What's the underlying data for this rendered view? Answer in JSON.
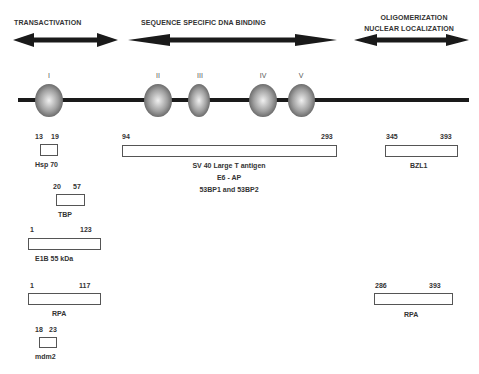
{
  "domains": [
    {
      "label": "TRANSACTIVATION"
    },
    {
      "label": "SEQUENCE SPECIFIC DNA BINDING"
    },
    {
      "label_line1": "OLIGOMERIZATION",
      "label_line2": "NUCLEAR LOCALIZATION"
    }
  ],
  "conserved_regions": [
    "I",
    "II",
    "III",
    "IV",
    "V"
  ],
  "binding_sites": [
    {
      "start": "13",
      "end": "19",
      "partner": "Hsp  70"
    },
    {
      "start": "20",
      "end": "57",
      "partner": "TBP"
    },
    {
      "start": "1",
      "end": "123",
      "partner": "E1B 55 kDa"
    },
    {
      "start": "1",
      "end": "117",
      "partner": "RPA"
    },
    {
      "start": "18",
      "end": "23",
      "partner": "mdm2"
    },
    {
      "start": "94",
      "end": "293",
      "partners": [
        "SV 40 Large T antigen",
        "E6 - AP",
        "53BP1 and 53BP2"
      ]
    },
    {
      "start": "345",
      "end": "393",
      "partner": "BZL1"
    },
    {
      "start": "286",
      "end": "393",
      "partner": "RPA"
    }
  ],
  "colors": {
    "arrow": "#1a1a1a",
    "line": "#1a1a1a",
    "sphere_light": "#e8e8e8",
    "sphere_dark": "#6a6a6a"
  }
}
